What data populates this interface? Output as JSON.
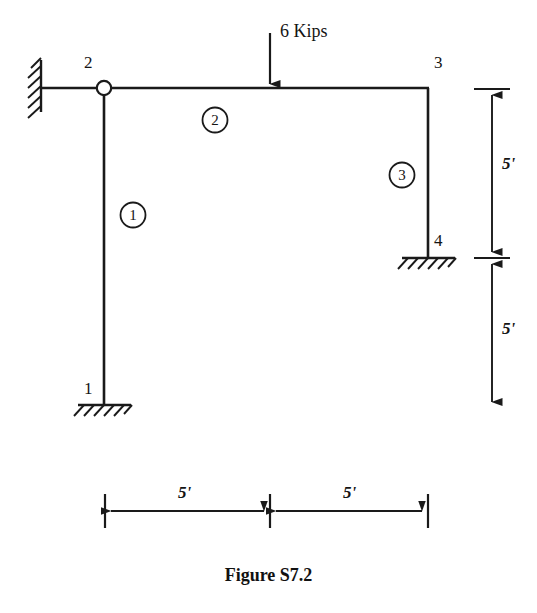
{
  "figure": {
    "caption": "Figure S7.2"
  },
  "load": {
    "label": "6 Kips",
    "magnitude": 6,
    "unit": "Kips",
    "direction": "down"
  },
  "nodes": [
    {
      "id": "1",
      "label": "1",
      "support": "fixed",
      "x": 104,
      "y": 405
    },
    {
      "id": "2",
      "label": "2",
      "support": "hinge",
      "x": 104,
      "y": 88
    },
    {
      "id": "3",
      "label": "3",
      "support": "none",
      "x": 428,
      "y": 88
    },
    {
      "id": "4",
      "label": "4",
      "support": "fixed",
      "x": 428,
      "y": 258
    }
  ],
  "members": [
    {
      "id": "1",
      "label": "1",
      "from": "1",
      "to": "2",
      "orientation": "vertical"
    },
    {
      "id": "2",
      "label": "2",
      "from": "2",
      "to": "3",
      "orientation": "horizontal"
    },
    {
      "id": "3",
      "label": "3",
      "from": "3",
      "to": "4",
      "orientation": "vertical"
    }
  ],
  "dimensions": {
    "vertical": [
      {
        "label": "5'",
        "value": 5,
        "unit": "ft",
        "span": "top"
      },
      {
        "label": "5'",
        "value": 5,
        "unit": "ft",
        "span": "bottom"
      }
    ],
    "horizontal": [
      {
        "label": "5'",
        "value": 5,
        "unit": "ft",
        "span": "left"
      },
      {
        "label": "5'",
        "value": 5,
        "unit": "ft",
        "span": "right"
      }
    ]
  },
  "icons": {
    "wall_support": "fixed-wall-hatch-icon",
    "ground_support": "fixed-ground-hatch-icon",
    "hinge": "hinge-circle-icon",
    "load_arrow": "down-arrow-icon"
  },
  "colors": {
    "line": "#1a1a1a",
    "background": "#ffffff",
    "text": "#141414"
  }
}
